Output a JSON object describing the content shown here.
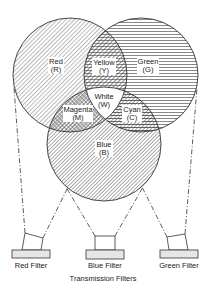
{
  "diagram": {
    "regions": {
      "red": {
        "name": "Red",
        "abbr": "(R)"
      },
      "green": {
        "name": "Green",
        "abbr": "(G)"
      },
      "blue": {
        "name": "Blue",
        "abbr": "(B)"
      },
      "yellow": {
        "name": "Yellow",
        "abbr": "(Y)"
      },
      "magenta": {
        "name": "Magenta",
        "abbr": "(M)"
      },
      "cyan": {
        "name": "Cyan",
        "abbr": "(C)"
      },
      "white": {
        "name": "White",
        "abbr": "(W)"
      }
    },
    "filters": [
      {
        "label": "Red Filter"
      },
      {
        "label": "Blue Filter"
      },
      {
        "label": "Green Filter"
      }
    ],
    "caption": "Transmission Filters"
  }
}
